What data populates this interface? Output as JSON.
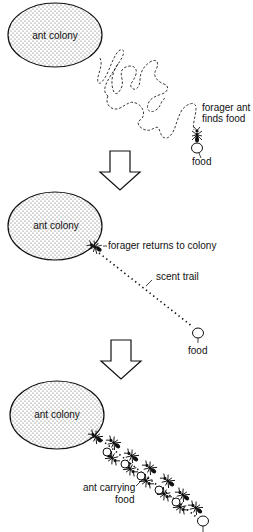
{
  "diagram": {
    "panels": [
      {
        "id": "panel-1",
        "colony_label": "ant colony",
        "forager_label_line1": "forager ant",
        "forager_label_line2": "finds food",
        "food_label": "food",
        "path_style": "dashed random search path"
      },
      {
        "id": "panel-2",
        "colony_label": "ant colony",
        "forager_label": "forager returns to colony",
        "trail_label": "scent trail",
        "food_label": "food",
        "path_style": "dotted straight trail"
      },
      {
        "id": "panel-3",
        "colony_label": "ant colony",
        "carrying_label_line1": "ant carrying",
        "carrying_label_line2": "food",
        "path_style": "column of ants along trail"
      }
    ],
    "arrows": [
      "down-arrow",
      "down-arrow"
    ],
    "colors": {
      "ink": "#111111",
      "background": "#ffffff",
      "colony_fill_dots": "#555555"
    }
  }
}
